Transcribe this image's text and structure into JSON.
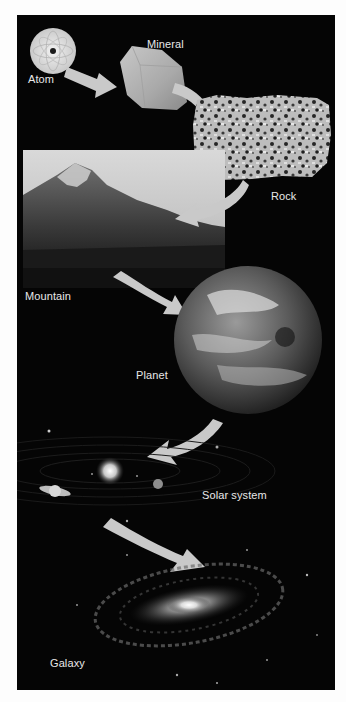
{
  "figure": {
    "colors": {
      "background": "#050505",
      "arrow": "#c9c9c9",
      "label": "#e8e8e8",
      "page": "#fdfdfd"
    },
    "stages": [
      {
        "id": "atom",
        "label": "Atom"
      },
      {
        "id": "mineral",
        "label": "Mineral"
      },
      {
        "id": "rock",
        "label": "Rock"
      },
      {
        "id": "mountain",
        "label": "Mountain"
      },
      {
        "id": "planet",
        "label": "Planet"
      },
      {
        "id": "solar-system",
        "label": "Solar system"
      },
      {
        "id": "galaxy",
        "label": "Galaxy"
      }
    ],
    "arrows": [
      {
        "from": "Atom",
        "to": "Mineral"
      },
      {
        "from": "Mineral",
        "to": "Rock"
      },
      {
        "from": "Rock",
        "to": "Mountain"
      },
      {
        "from": "Mountain",
        "to": "Planet"
      },
      {
        "from": "Planet",
        "to": "Solar system"
      },
      {
        "from": "Solar system",
        "to": "Galaxy"
      }
    ]
  }
}
